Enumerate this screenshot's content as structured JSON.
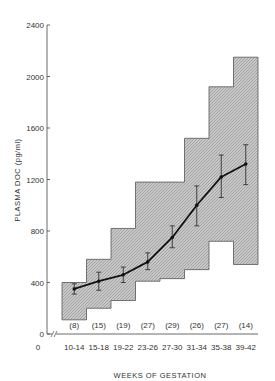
{
  "chart_data": {
    "type": "line",
    "title": "",
    "xlabel": "WEEKS OF GESTATION",
    "ylabel": "PLASMA DOC (pg/ml)",
    "ylim": [
      0,
      2400
    ],
    "yticks": [
      0,
      400,
      800,
      1200,
      1600,
      2000,
      2400
    ],
    "x_origin_label": "0",
    "categories": [
      "10-14",
      "15-18",
      "19-22",
      "23-26",
      "27-30",
      "31-34",
      "35-38",
      "39-42"
    ],
    "n_labels": [
      "(8)",
      "(15)",
      "(19)",
      "(27)",
      "(29)",
      "(26)",
      "(27)",
      "(14)"
    ],
    "series": [
      {
        "name": "Mean ± SEM",
        "values": [
          350,
          410,
          460,
          560,
          750,
          1000,
          1220,
          1320
        ],
        "err_low": [
          310,
          340,
          400,
          500,
          670,
          840,
          1060,
          1160
        ],
        "err_high": [
          390,
          480,
          520,
          630,
          840,
          1150,
          1390,
          1470
        ]
      },
      {
        "name": "Range (shaded)",
        "low": [
          110,
          200,
          260,
          410,
          430,
          500,
          720,
          540
        ],
        "high": [
          400,
          580,
          820,
          1180,
          1180,
          1520,
          1920,
          2150
        ]
      }
    ],
    "grid": false,
    "legend": "none"
  },
  "axis": {
    "y_title": "PLASMA DOC (pg/ml)",
    "x_title": "WEEKS OF GESTATION",
    "y_ticks": [
      "2400",
      "2000",
      "1600",
      "1200",
      "800",
      "400",
      "0"
    ],
    "x_zero": "0"
  }
}
